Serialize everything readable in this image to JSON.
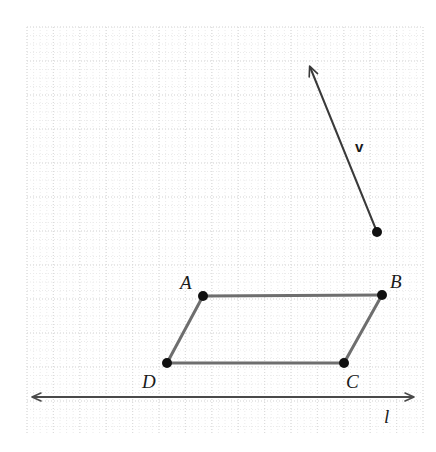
{
  "figure": {
    "kind": "geometry-diagram",
    "width": 436,
    "height": 452,
    "background_color": "#ffffff"
  },
  "grid": {
    "visible": true,
    "style": "dotted",
    "minor_color": "#ebebeb",
    "major_color": "#dcdcdc",
    "cell_width": 26.4,
    "cell_height": 34,
    "origin_x": 27,
    "origin_y": 27,
    "right_edge": 423,
    "bottom_edge": 433
  },
  "colors": {
    "shape_stroke": "#6e6e6e",
    "vector_stroke": "#3a3a3a",
    "line_stroke": "#4a4a4a",
    "point_fill": "#111111",
    "label_text": "#1a1a1a"
  },
  "parallelogram": {
    "name": "ABCD",
    "stroke_width": 3,
    "vertices": [
      {
        "id": "A",
        "label": "A",
        "x": 203,
        "y": 296,
        "label_x": 180,
        "label_y": 273
      },
      {
        "id": "B",
        "label": "B",
        "x": 382,
        "y": 295,
        "label_x": 390,
        "label_y": 272
      },
      {
        "id": "C",
        "label": "C",
        "x": 344,
        "y": 363,
        "label_x": 346,
        "label_y": 372
      },
      {
        "id": "D",
        "label": "D",
        "x": 167,
        "y": 363,
        "label_x": 142,
        "label_y": 372
      }
    ],
    "edges": [
      {
        "from": "A",
        "to": "B"
      },
      {
        "from": "B",
        "to": "C"
      },
      {
        "from": "C",
        "to": "D"
      },
      {
        "from": "D",
        "to": "A"
      }
    ],
    "point_radius": 5
  },
  "vector": {
    "label": "v",
    "label_x": 355,
    "label_y": 139,
    "tail_x": 377,
    "tail_y": 232,
    "head_x": 310,
    "head_y": 67,
    "stroke_width": 2,
    "tail_dot_radius": 5,
    "arrowhead": "open"
  },
  "line": {
    "label": "l",
    "label_x": 384,
    "label_y": 407,
    "y": 397,
    "x_start": 33,
    "x_end": 413,
    "stroke_width": 2,
    "arrowheads": "both"
  }
}
